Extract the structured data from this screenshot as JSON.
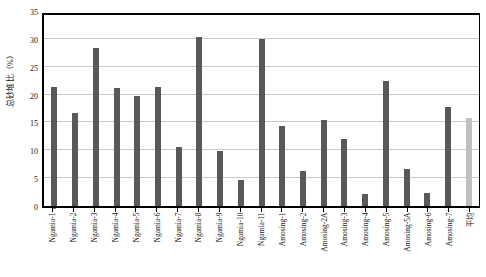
{
  "chart_data": {
    "type": "bar",
    "title": "",
    "xlabel": "",
    "ylabel": "总砂堆比（%）",
    "ylim": [
      0,
      35
    ],
    "yticks": [
      0,
      5,
      10,
      15,
      20,
      25,
      30,
      35
    ],
    "grid": true,
    "legend": false,
    "categories": [
      "Ngamia-1",
      "Ngamia-2",
      "Ngamia-3",
      "Ngamia-4",
      "Ngamia-5",
      "Ngamia-6",
      "Ngamia-7",
      "Ngamia-8",
      "Ngamia-9",
      "Ngamia-10",
      "Ngamia-11",
      "Amosing-1",
      "Amosing-2",
      "Amosing-2A",
      "Amosing-3",
      "Amosing-4",
      "Amosing-5",
      "Amosing-5A",
      "Amosing-6",
      "Amosing-7",
      "平均"
    ],
    "values": [
      21.3,
      16.7,
      28.4,
      21.1,
      19.8,
      21.3,
      10.6,
      30.3,
      9.8,
      4.6,
      30.0,
      14.4,
      6.2,
      15.4,
      12.0,
      2.1,
      22.4,
      6.6,
      2.4,
      17.8,
      15.8
    ],
    "bar_colors": [
      "#595959",
      "#595959",
      "#595959",
      "#595959",
      "#595959",
      "#595959",
      "#595959",
      "#595959",
      "#595959",
      "#595959",
      "#595959",
      "#595959",
      "#595959",
      "#595959",
      "#595959",
      "#595959",
      "#595959",
      "#595959",
      "#595959",
      "#595959",
      "#bfbfbf"
    ],
    "colors": {
      "bar_default": "#595959",
      "bar_average": "#bfbfbf",
      "grid": "#c9c9c9",
      "axis": "#000000",
      "text": "#1a1a1a",
      "background": "#ffffff"
    }
  }
}
